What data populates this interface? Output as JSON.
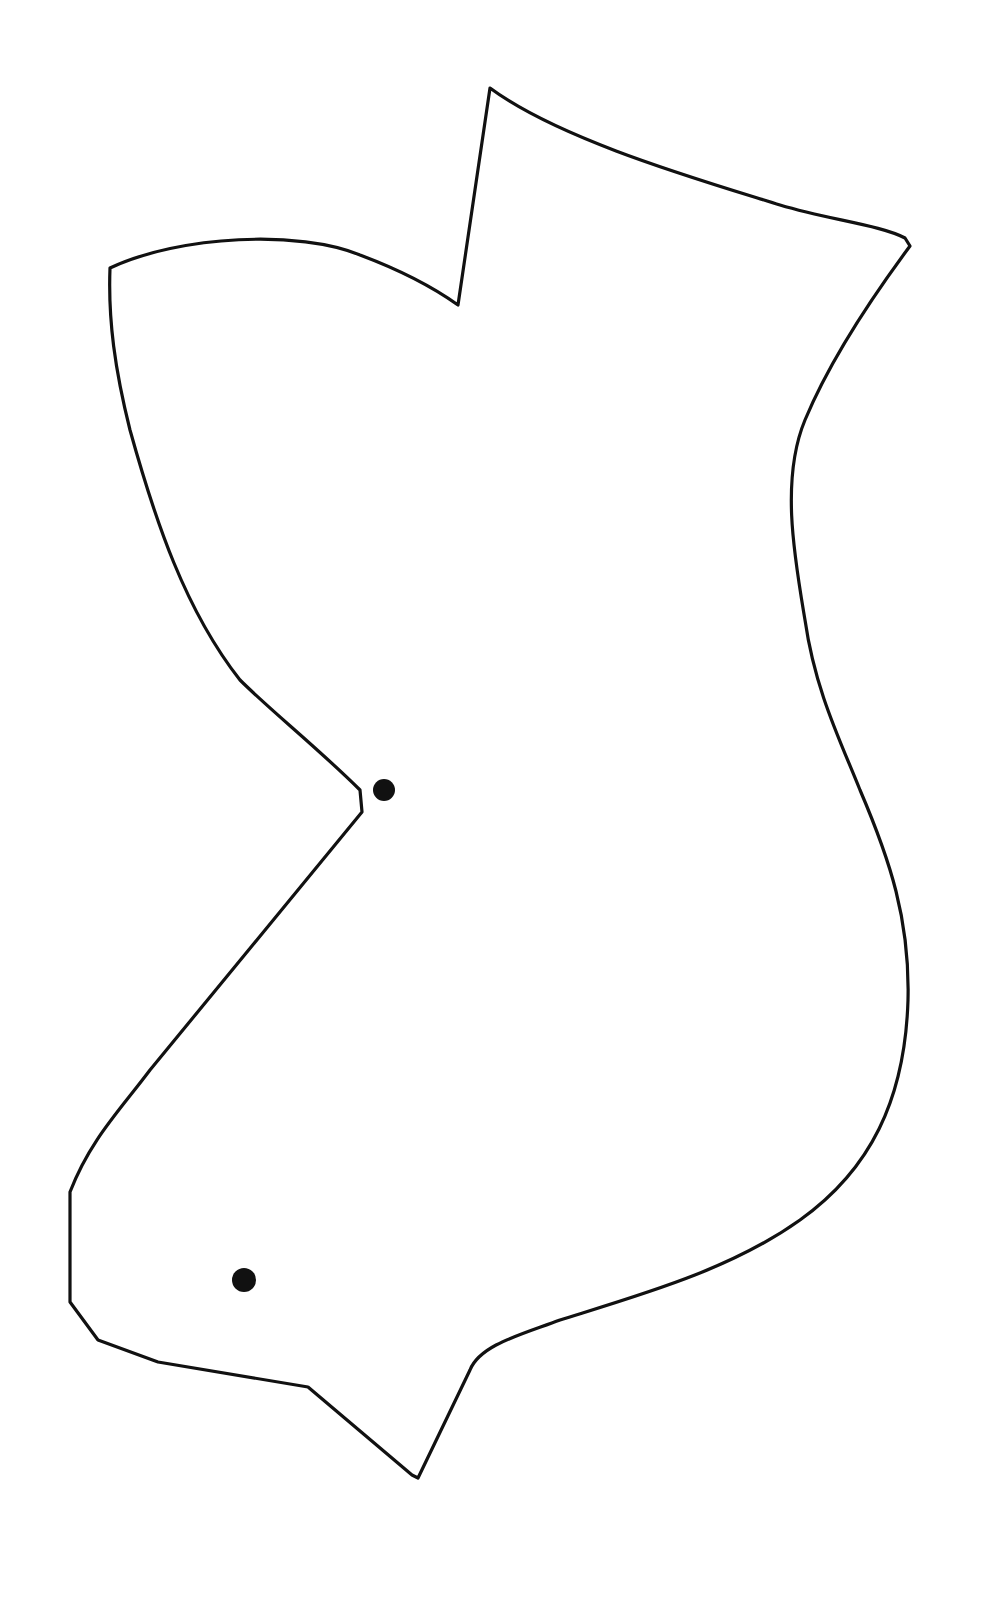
{
  "figure": {
    "type": "outline-shape",
    "background": "#ffffff",
    "stroke_color": "#111111",
    "dots": [
      {
        "name": "upper-dot",
        "cx": 384,
        "cy": 790,
        "r": 11
      },
      {
        "name": "lower-dot",
        "cx": 244,
        "cy": 1280,
        "r": 12
      }
    ]
  }
}
